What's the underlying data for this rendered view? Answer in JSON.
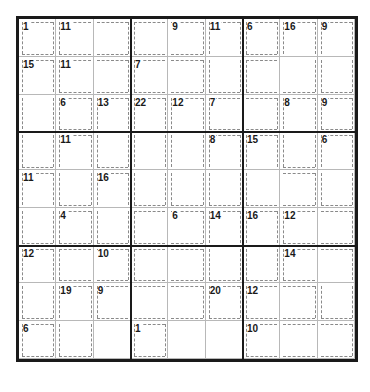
{
  "puzzle": {
    "type": "killer-sudoku",
    "size": 9,
    "cages": [
      {
        "sum": 1,
        "cells": [
          [
            0,
            0
          ]
        ]
      },
      {
        "sum": 11,
        "cells": [
          [
            0,
            1
          ],
          [
            0,
            2
          ]
        ]
      },
      {
        "sum": 9,
        "cells": [
          [
            0,
            3
          ],
          [
            0,
            4
          ]
        ]
      },
      {
        "sum": 11,
        "cells": [
          [
            0,
            5
          ],
          [
            1,
            5
          ]
        ]
      },
      {
        "sum": 6,
        "cells": [
          [
            0,
            6
          ]
        ]
      },
      {
        "sum": 16,
        "cells": [
          [
            0,
            7
          ],
          [
            1,
            6
          ],
          [
            1,
            7
          ]
        ]
      },
      {
        "sum": 9,
        "cells": [
          [
            0,
            8
          ],
          [
            1,
            8
          ]
        ]
      },
      {
        "sum": 15,
        "cells": [
          [
            1,
            0
          ],
          [
            2,
            0
          ],
          [
            3,
            0
          ]
        ]
      },
      {
        "sum": 11,
        "cells": [
          [
            1,
            1
          ],
          [
            1,
            2
          ]
        ]
      },
      {
        "sum": 7,
        "cells": [
          [
            1,
            3
          ],
          [
            1,
            4
          ],
          [
            2,
            4
          ]
        ]
      },
      {
        "sum": 6,
        "cells": [
          [
            2,
            1
          ]
        ]
      },
      {
        "sum": 13,
        "cells": [
          [
            2,
            2
          ],
          [
            3,
            2
          ]
        ]
      },
      {
        "sum": 22,
        "cells": [
          [
            2,
            3
          ],
          [
            3,
            3
          ],
          [
            4,
            3
          ]
        ]
      },
      {
        "sum": 12,
        "cells": [
          [
            2,
            4
          ],
          [
            3,
            4
          ],
          [
            4,
            4
          ]
        ]
      },
      {
        "sum": 7,
        "cells": [
          [
            2,
            5
          ],
          [
            2,
            6
          ]
        ]
      },
      {
        "sum": 8,
        "cells": [
          [
            2,
            7
          ],
          [
            3,
            7
          ]
        ]
      },
      {
        "sum": 9,
        "cells": [
          [
            2,
            8
          ]
        ]
      },
      {
        "sum": 11,
        "cells": [
          [
            3,
            1
          ],
          [
            4,
            1
          ]
        ]
      },
      {
        "sum": 8,
        "cells": [
          [
            3,
            5
          ],
          [
            4,
            5
          ]
        ]
      },
      {
        "sum": 15,
        "cells": [
          [
            3,
            6
          ],
          [
            4,
            6
          ],
          [
            4,
            7
          ]
        ]
      },
      {
        "sum": 6,
        "cells": [
          [
            3,
            8
          ],
          [
            4,
            8
          ]
        ]
      },
      {
        "sum": 11,
        "cells": [
          [
            4,
            0
          ],
          [
            5,
            0
          ]
        ]
      },
      {
        "sum": 16,
        "cells": [
          [
            4,
            2
          ],
          [
            5,
            2
          ]
        ]
      },
      {
        "sum": 4,
        "cells": [
          [
            5,
            1
          ]
        ]
      },
      {
        "sum": 6,
        "cells": [
          [
            5,
            3
          ],
          [
            5,
            4
          ]
        ]
      },
      {
        "sum": 14,
        "cells": [
          [
            5,
            5
          ],
          [
            6,
            5
          ]
        ]
      },
      {
        "sum": 16,
        "cells": [
          [
            5,
            6
          ],
          [
            6,
            6
          ]
        ]
      },
      {
        "sum": 12,
        "cells": [
          [
            5,
            7
          ],
          [
            5,
            8
          ]
        ]
      },
      {
        "sum": 12,
        "cells": [
          [
            6,
            0
          ],
          [
            7,
            0
          ]
        ]
      },
      {
        "sum": 10,
        "cells": [
          [
            6,
            1
          ],
          [
            6,
            2
          ]
        ]
      },
      {
        "sum": 14,
        "cells": [
          [
            6,
            7
          ],
          [
            6,
            8
          ],
          [
            7,
            8
          ]
        ]
      },
      {
        "sum": 19,
        "cells": [
          [
            7,
            1
          ],
          [
            8,
            1
          ]
        ]
      },
      {
        "sum": 9,
        "cells": [
          [
            7,
            2
          ],
          [
            7,
            3
          ],
          [
            7,
            4
          ]
        ]
      },
      {
        "sum": 20,
        "cells": [
          [
            6,
            3
          ],
          [
            6,
            4
          ],
          [
            7,
            5
          ]
        ]
      },
      {
        "sum": 12,
        "cells": [
          [
            7,
            6
          ],
          [
            7,
            7
          ]
        ]
      },
      {
        "sum": 6,
        "cells": [
          [
            8,
            0
          ]
        ]
      },
      {
        "sum": 1,
        "cells": [
          [
            8,
            3
          ]
        ]
      },
      {
        "sum": 10,
        "cells": [
          [
            8,
            6
          ],
          [
            8,
            7
          ],
          [
            8,
            8
          ]
        ]
      }
    ],
    "clues": [
      [
        1,
        11,
        null,
        null,
        9,
        11,
        6,
        16,
        9
      ],
      [
        15,
        11,
        null,
        7,
        null,
        null,
        null,
        null,
        null
      ],
      [
        null,
        6,
        13,
        22,
        12,
        7,
        null,
        8,
        9
      ],
      [
        null,
        11,
        null,
        null,
        null,
        8,
        15,
        null,
        6
      ],
      [
        11,
        null,
        16,
        null,
        null,
        null,
        null,
        null,
        null
      ],
      [
        null,
        4,
        null,
        null,
        6,
        14,
        16,
        12,
        null
      ],
      [
        12,
        null,
        10,
        null,
        null,
        null,
        null,
        14,
        null
      ],
      [
        null,
        19,
        9,
        null,
        null,
        20,
        12,
        null,
        null
      ],
      [
        6,
        null,
        null,
        1,
        null,
        null,
        10,
        null,
        null
      ]
    ]
  }
}
